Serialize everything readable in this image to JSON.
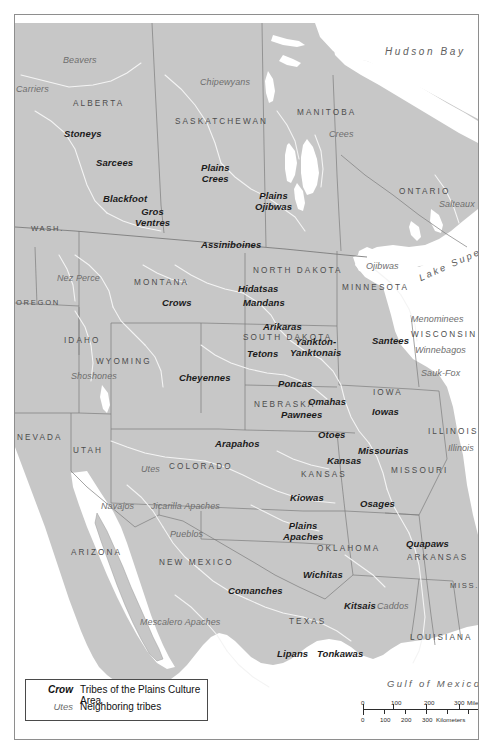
{
  "map": {
    "title_implicit": "Tribes of the Plains Culture Area",
    "land_color": "#c7c7c7",
    "water_color": "#ffffff",
    "border_color": "#7a7a7a",
    "river_color": "#f2f2f2",
    "frame_color": "#8e8e8e"
  },
  "water_bodies": [
    {
      "name": "Hudson Bay",
      "x": 370,
      "y": 38,
      "class": "water lg"
    },
    {
      "name": "Lake Superior",
      "x": 404,
      "y": 253,
      "class": "water rot"
    },
    {
      "name": "Gulf of Mexico",
      "x": 372,
      "y": 670,
      "class": "water"
    }
  ],
  "places": [
    {
      "name": "ALBERTA",
      "x": 72,
      "y": 88
    },
    {
      "name": "SASKATCHEWAN",
      "x": 174,
      "y": 106
    },
    {
      "name": "MANITOBA",
      "x": 296,
      "y": 97
    },
    {
      "name": "ONTARIO",
      "x": 398,
      "y": 176
    },
    {
      "name": "WASH.",
      "x": 30,
      "y": 214
    },
    {
      "name": "OREGON",
      "x": 15,
      "y": 288
    },
    {
      "name": "MONTANA",
      "x": 133,
      "y": 268
    },
    {
      "name": "NORTH DAKOTA",
      "x": 252,
      "y": 255
    },
    {
      "name": "MINNESOTA",
      "x": 341,
      "y": 272
    },
    {
      "name": "IDAHO",
      "x": 63,
      "y": 325
    },
    {
      "name": "SOUTH DAKOTA",
      "x": 242,
      "y": 322
    },
    {
      "name": "WISCONSIN",
      "x": 410,
      "y": 319
    },
    {
      "name": "WYOMING",
      "x": 95,
      "y": 346
    },
    {
      "name": "NEBRASKA",
      "x": 253,
      "y": 389
    },
    {
      "name": "IOWA",
      "x": 372,
      "y": 377
    },
    {
      "name": "NEVADA",
      "x": 16,
      "y": 422
    },
    {
      "name": "UTAH",
      "x": 72,
      "y": 435
    },
    {
      "name": "COLORADO",
      "x": 168,
      "y": 451
    },
    {
      "name": "ILLINOIS",
      "x": 427,
      "y": 416
    },
    {
      "name": "KANSAS",
      "x": 300,
      "y": 459
    },
    {
      "name": "MISSOURI",
      "x": 390,
      "y": 455
    },
    {
      "name": "ARIZONA",
      "x": 70,
      "y": 537
    },
    {
      "name": "NEW MEXICO",
      "x": 158,
      "y": 547
    },
    {
      "name": "OKLAHOMA",
      "x": 316,
      "y": 533
    },
    {
      "name": "ARKANSAS",
      "x": 406,
      "y": 542
    },
    {
      "name": "MISS.",
      "x": 449,
      "y": 570
    },
    {
      "name": "TEXAS",
      "x": 288,
      "y": 606
    },
    {
      "name": "LOUISIANA",
      "x": 409,
      "y": 622
    }
  ],
  "plains_tribes": [
    {
      "name": "Stoneys",
      "x": 63,
      "y": 117
    },
    {
      "name": "Sarcees",
      "x": 95,
      "y": 146
    },
    {
      "name": "Plains\nCrees",
      "x": 200,
      "y": 152
    },
    {
      "name": "Blackfoot",
      "x": 103,
      "y": 182
    },
    {
      "name": "Plains\nOjibwas",
      "x": 256,
      "y": 180
    },
    {
      "name": "Gros\nVentres",
      "x": 135,
      "y": 196
    },
    {
      "name": "Assiniboines",
      "x": 203,
      "y": 228
    },
    {
      "name": "Crows",
      "x": 160,
      "y": 286
    },
    {
      "name": "Hidatsas",
      "x": 240,
      "y": 272
    },
    {
      "name": "Mandans",
      "x": 246,
      "y": 286
    },
    {
      "name": "Arikaras",
      "x": 263,
      "y": 310
    },
    {
      "name": "Tetons",
      "x": 246,
      "y": 337
    },
    {
      "name": "Yankton-\nYanktonais",
      "x": 300,
      "y": 327
    },
    {
      "name": "Santees",
      "x": 373,
      "y": 324
    },
    {
      "name": "Cheyennes",
      "x": 185,
      "y": 361
    },
    {
      "name": "Poncas",
      "x": 280,
      "y": 367
    },
    {
      "name": "Omahas",
      "x": 310,
      "y": 385
    },
    {
      "name": "Pawnees",
      "x": 285,
      "y": 398
    },
    {
      "name": "Iowas",
      "x": 370,
      "y": 395
    },
    {
      "name": "Otoes",
      "x": 318,
      "y": 418
    },
    {
      "name": "Arapahos",
      "x": 222,
      "y": 427
    },
    {
      "name": "Missourias",
      "x": 365,
      "y": 434
    },
    {
      "name": "Kansas",
      "x": 330,
      "y": 443
    },
    {
      "name": "Kiowas",
      "x": 290,
      "y": 481
    },
    {
      "name": "Osages",
      "x": 362,
      "y": 487
    },
    {
      "name": "Plains\nApaches",
      "x": 288,
      "y": 512
    },
    {
      "name": "Quapaws",
      "x": 410,
      "y": 527
    },
    {
      "name": "Wichitas",
      "x": 307,
      "y": 558
    },
    {
      "name": "Comanches",
      "x": 237,
      "y": 574
    },
    {
      "name": "Kitsais",
      "x": 344,
      "y": 589
    },
    {
      "name": "Lipans",
      "x": 275,
      "y": 637
    },
    {
      "name": "Tonkawas",
      "x": 320,
      "y": 637
    }
  ],
  "neighboring_tribes": [
    {
      "name": "Beavers",
      "x": 62,
      "y": 44
    },
    {
      "name": "Chipewyans",
      "x": 203,
      "y": 66
    },
    {
      "name": "Carriers",
      "x": 14,
      "y": 73
    },
    {
      "name": "Crees",
      "x": 328,
      "y": 118
    },
    {
      "name": "Salteaux",
      "x": 447,
      "y": 188
    },
    {
      "name": "Nez Perce",
      "x": 63,
      "y": 262
    },
    {
      "name": "Ojibwas",
      "x": 371,
      "y": 250
    },
    {
      "name": "Menominees",
      "x": 423,
      "y": 303
    },
    {
      "name": "Winnebagos",
      "x": 427,
      "y": 334
    },
    {
      "name": "Shoshones",
      "x": 78,
      "y": 360
    },
    {
      "name": "Sauk-Fox",
      "x": 424,
      "y": 357
    },
    {
      "name": "Illinois",
      "x": 448,
      "y": 432
    },
    {
      "name": "Utes",
      "x": 138,
      "y": 453
    },
    {
      "name": "Navajos",
      "x": 104,
      "y": 490
    },
    {
      "name": "Jicarilla Apaches",
      "x": 160,
      "y": 490
    },
    {
      "name": "Pueblos",
      "x": 172,
      "y": 518
    },
    {
      "name": "Caddos",
      "x": 379,
      "y": 590
    },
    {
      "name": "Mescalero Apaches",
      "x": 155,
      "y": 606
    }
  ],
  "legend": {
    "rows": [
      {
        "key": "Crow",
        "text": "Tribes of the Plains Culture Area",
        "type": "bold"
      },
      {
        "key": "Utes",
        "text": "Neighboring tribes",
        "type": "neighbor"
      }
    ]
  },
  "scale_bar": {
    "miles": {
      "ticks": [
        "0",
        "100",
        "200",
        "300"
      ],
      "unit": "Miles"
    },
    "kilometers": {
      "ticks": [
        "0",
        "100",
        "200",
        "300"
      ],
      "unit": "Kilometers"
    }
  }
}
